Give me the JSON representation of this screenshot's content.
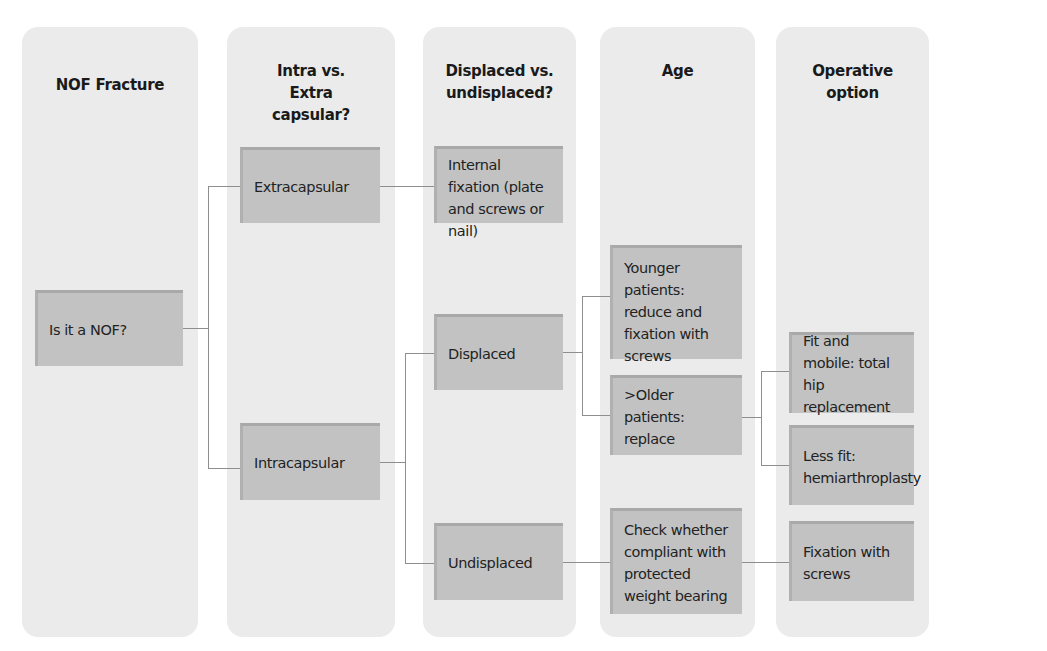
{
  "columns": [
    {
      "id": "nof",
      "title": "NOF Fracture"
    },
    {
      "id": "capsular",
      "title": "Intra vs. Extra capsular?"
    },
    {
      "id": "displaced",
      "title": "Displaced vs. undisplaced?"
    },
    {
      "id": "age",
      "title": "Age"
    },
    {
      "id": "operative",
      "title": "Operative option"
    }
  ],
  "nodes": {
    "is_nof": "Is it a NOF?",
    "extracapsular": "Extracapsular",
    "intracapsular": "Intracapsular",
    "internal_fixation": "Internal fixation (plate and screws or nail)",
    "displaced": "Displaced",
    "undisplaced": "Undisplaced",
    "younger": "Younger patients: reduce and fixation with screws",
    "older": ">Older patients: replace",
    "check_compliant": "Check whether compliant with protected weight bearing",
    "fit_mobile": "Fit and mobile: total hip replacement",
    "less_fit": "Less fit: hemiarthroplasty",
    "fixation_screws": "Fixation with screws"
  },
  "colors": {
    "column_bg": "#ebebeb",
    "box_bg": "#c2c2c2",
    "connector": "#8e8e8e"
  }
}
